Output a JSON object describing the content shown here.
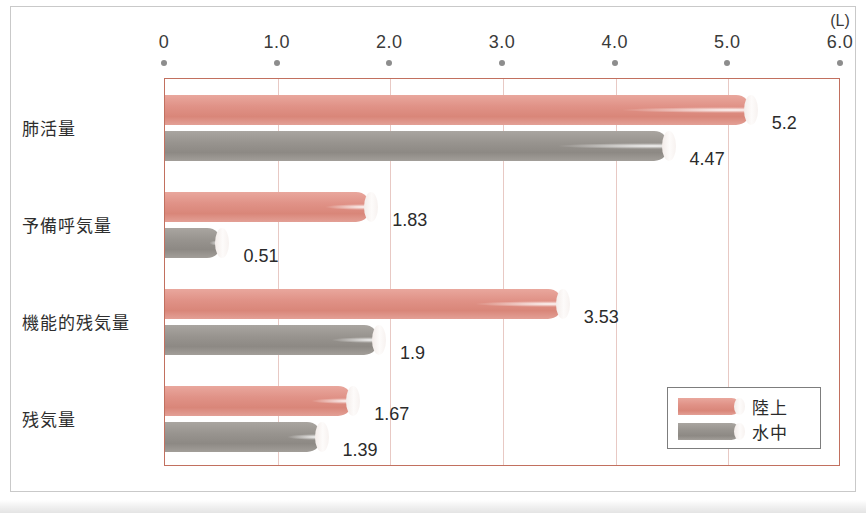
{
  "chart_data": {
    "type": "bar",
    "orientation": "horizontal",
    "title": "",
    "xlabel": "",
    "ylabel": "",
    "unit_label": "(L)",
    "xlim": [
      0,
      6.0
    ],
    "grid": true,
    "grid_axis": "x",
    "legend_position": "bottom-right",
    "categories": [
      "肺活量",
      "予備呼気量",
      "機能的残気量",
      "残気量"
    ],
    "x_tick_labels": [
      "0",
      "1.0",
      "2.0",
      "3.0",
      "4.0",
      "5.0",
      "6.0"
    ],
    "x_tick_values": [
      0,
      1.0,
      2.0,
      3.0,
      4.0,
      5.0,
      6.0
    ],
    "series": [
      {
        "name": "陸上",
        "color": "#e09287",
        "values": [
          5.2,
          1.83,
          3.53,
          1.67
        ],
        "value_labels": [
          "5.2",
          "1.83",
          "3.53",
          "1.67"
        ]
      },
      {
        "name": "水中",
        "color": "#98948f",
        "values": [
          4.47,
          0.51,
          1.9,
          1.39
        ],
        "value_labels": [
          "4.47",
          "0.51",
          "1.9",
          "1.39"
        ]
      }
    ]
  },
  "legend": {
    "items": [
      {
        "label": "陸上",
        "color": "#e09287"
      },
      {
        "label": "水中",
        "color": "#98948f"
      }
    ]
  },
  "colors": {
    "land_bar": "#e09287",
    "water_bar": "#98948f",
    "plot_border": "#c2705f",
    "gridline": "#e8c9c4",
    "outer_frame": "#c9c9c9",
    "tick_dot": "#8d8d8d",
    "text": "#2b2b2b"
  }
}
